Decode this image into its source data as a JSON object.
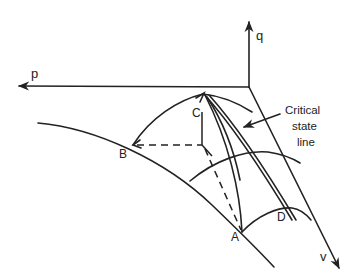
{
  "diagram": {
    "type": "critical-state-space",
    "stroke_color": "#222222",
    "background": "#ffffff",
    "axes": {
      "p": {
        "label": "p"
      },
      "q": {
        "label": "q"
      },
      "v": {
        "label": "v"
      }
    },
    "points": {
      "A": {
        "label": "A"
      },
      "B": {
        "label": "B"
      },
      "C": {
        "label": "C"
      },
      "D": {
        "label": "D"
      }
    },
    "annotation": {
      "line1": "Critical",
      "line2": "state",
      "line3": "line"
    }
  }
}
